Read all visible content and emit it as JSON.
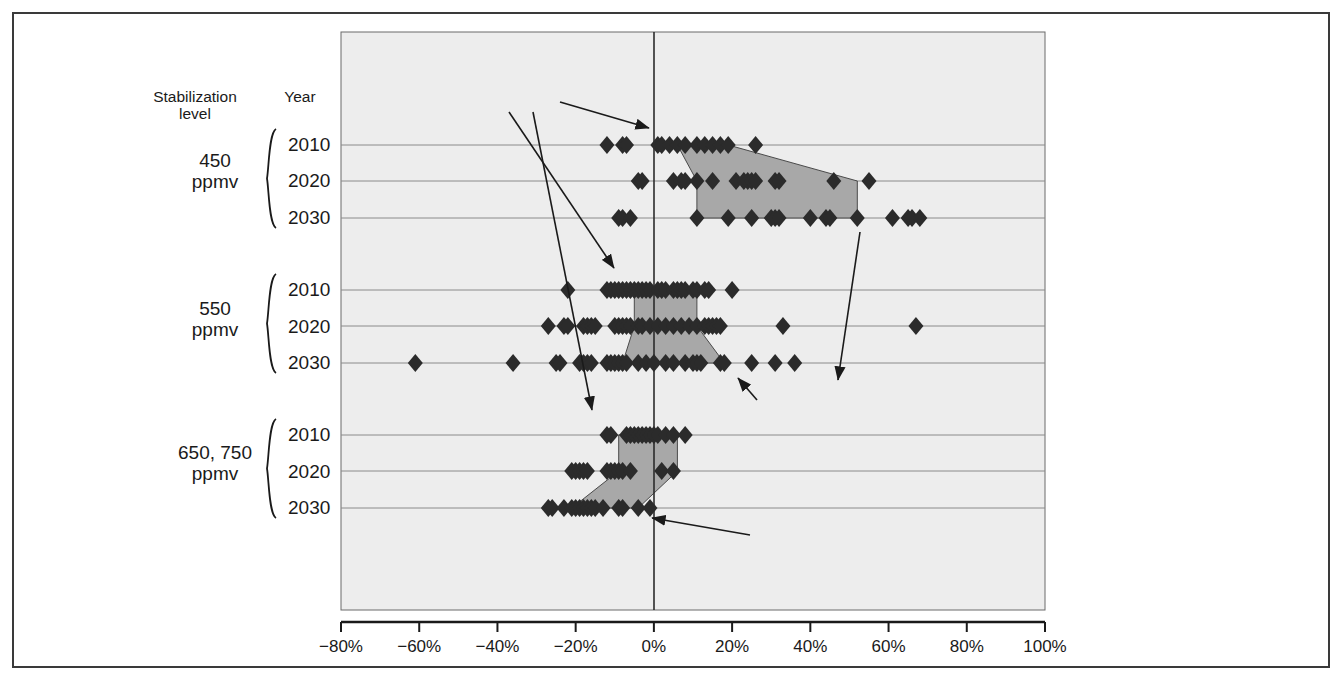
{
  "figure": {
    "background": "#ffffff",
    "frame_color": "#3a3a3a",
    "plot_background": "#ededed",
    "marker_color": "#2b2b2b",
    "band_fill": "#a8a8a8",
    "gridline_color": "#8a8a8a"
  },
  "headers": {
    "stabilization_header_line1": "Stabilization",
    "stabilization_header_line2": "level",
    "year_header": "Year"
  },
  "groups": [
    {
      "level_line1": "450",
      "level_line2": "ppmv",
      "years": [
        "2010",
        "2020",
        "2030"
      ]
    },
    {
      "level_line1": "550",
      "level_line2": "ppmv",
      "years": [
        "2010",
        "2020",
        "2030"
      ]
    },
    {
      "level_line1": "650, 750",
      "level_line2": "ppmv",
      "years": [
        "2010",
        "2020",
        "2030"
      ]
    }
  ],
  "annotations": [
    {
      "name": "p25-label",
      "text_prefix": "25",
      "text_sup": "th",
      "text_suffix": " percentile"
    },
    {
      "name": "p75-label",
      "text_prefix": "75",
      "text_sup": "th",
      "text_suffix": " percentile"
    }
  ],
  "value_labels": [
    {
      "name": "g450-2010-p25",
      "text": "6%"
    },
    {
      "name": "g450-2010-p75",
      "text": "19%"
    },
    {
      "name": "g450-2030-p25",
      "text": "11%"
    },
    {
      "name": "g450-2030-p75",
      "text": "52%"
    },
    {
      "name": "g550-2010-p25",
      "text": "−5%"
    },
    {
      "name": "g550-2010-p75",
      "text": "11%"
    },
    {
      "name": "g550-2030-p25",
      "text": "−8%"
    },
    {
      "name": "g550-2030-p75",
      "text": "18%"
    },
    {
      "name": "g650-2010-p25",
      "text": "−9%"
    },
    {
      "name": "g650-2010-p75",
      "text": "6%"
    },
    {
      "name": "g650-2030-p25",
      "text": "−21%"
    },
    {
      "name": "g650-2030-p75",
      "text": "−4%"
    }
  ],
  "chart_data": {
    "type": "scatter",
    "title": "",
    "xlabel": "",
    "ylabel": "",
    "xlim": [
      -80,
      100
    ],
    "xticks": [
      -80,
      -60,
      -40,
      -20,
      0,
      20,
      40,
      60,
      80,
      100
    ],
    "xticklabels": [
      "−80%",
      "−60%",
      "−40%",
      "−20%",
      "0%",
      "20%",
      "40%",
      "60%",
      "80%",
      "100%"
    ],
    "grid": true,
    "grid_axis": "y",
    "legend": "none",
    "zero_reference_line": 0,
    "rows": [
      {
        "group": "450 ppmv",
        "year": "2010",
        "p25": 6,
        "p75": 19,
        "values": [
          -12,
          -8,
          -7,
          1,
          2,
          4,
          6,
          8,
          11,
          13,
          15,
          17,
          19,
          26
        ]
      },
      {
        "group": "450 ppmv",
        "year": "2020",
        "p25": 11,
        "p75": 52,
        "values": [
          -4,
          -3,
          5,
          7,
          8,
          11,
          15,
          21,
          23,
          24,
          25,
          26,
          31,
          32,
          46,
          55
        ]
      },
      {
        "group": "450 ppmv",
        "year": "2030",
        "p25": 11,
        "p75": 52,
        "values": [
          -9,
          -8,
          -6,
          11,
          19,
          25,
          30,
          31,
          32,
          40,
          44,
          45,
          52,
          61,
          65,
          66,
          68
        ]
      },
      {
        "group": "550 ppmv",
        "year": "2010",
        "p25": -5,
        "p75": 11,
        "values": [
          -22,
          -12,
          -11,
          -10,
          -9,
          -8,
          -7,
          -6,
          -5,
          -4,
          -3,
          -2,
          -1,
          1,
          2,
          3,
          5,
          6,
          7,
          8,
          10,
          11,
          13,
          14,
          20
        ]
      },
      {
        "group": "550 ppmv",
        "year": "2020",
        "p25": -5,
        "p75": 11,
        "values": [
          -27,
          -23,
          -22,
          -18,
          -17,
          -16,
          -15,
          -10,
          -9,
          -8,
          -7,
          -6,
          -4,
          -3,
          -1,
          1,
          3,
          5,
          7,
          9,
          11,
          13,
          14,
          15,
          16,
          17,
          33,
          67
        ]
      },
      {
        "group": "550 ppmv",
        "year": "2030",
        "p25": -8,
        "p75": 18,
        "values": [
          -61,
          -36,
          -25,
          -24,
          -19,
          -18,
          -17,
          -16,
          -12,
          -11,
          -10,
          -9,
          -8,
          -7,
          -4,
          -2,
          0,
          3,
          5,
          8,
          10,
          11,
          12,
          17,
          18,
          25,
          31,
          36
        ]
      },
      {
        "group": "650, 750 ppmv",
        "year": "2010",
        "p25": -9,
        "p75": 6,
        "values": [
          -12,
          -11,
          -7,
          -6,
          -5,
          -4,
          -3,
          -2,
          -1,
          0,
          1,
          3,
          5,
          8
        ]
      },
      {
        "group": "650, 750 ppmv",
        "year": "2020",
        "p25": -9,
        "p75": 6,
        "values": [
          -21,
          -20,
          -19,
          -18,
          -17,
          -12,
          -11,
          -10,
          -9,
          -8,
          -6,
          2,
          5
        ]
      },
      {
        "group": "650, 750 ppmv",
        "year": "2030",
        "p25": -21,
        "p75": -4,
        "values": [
          -27,
          -26,
          -23,
          -21,
          -20,
          -19,
          -18,
          -17,
          -16,
          -15,
          -13,
          -9,
          -8,
          -4,
          -1
        ]
      }
    ]
  }
}
